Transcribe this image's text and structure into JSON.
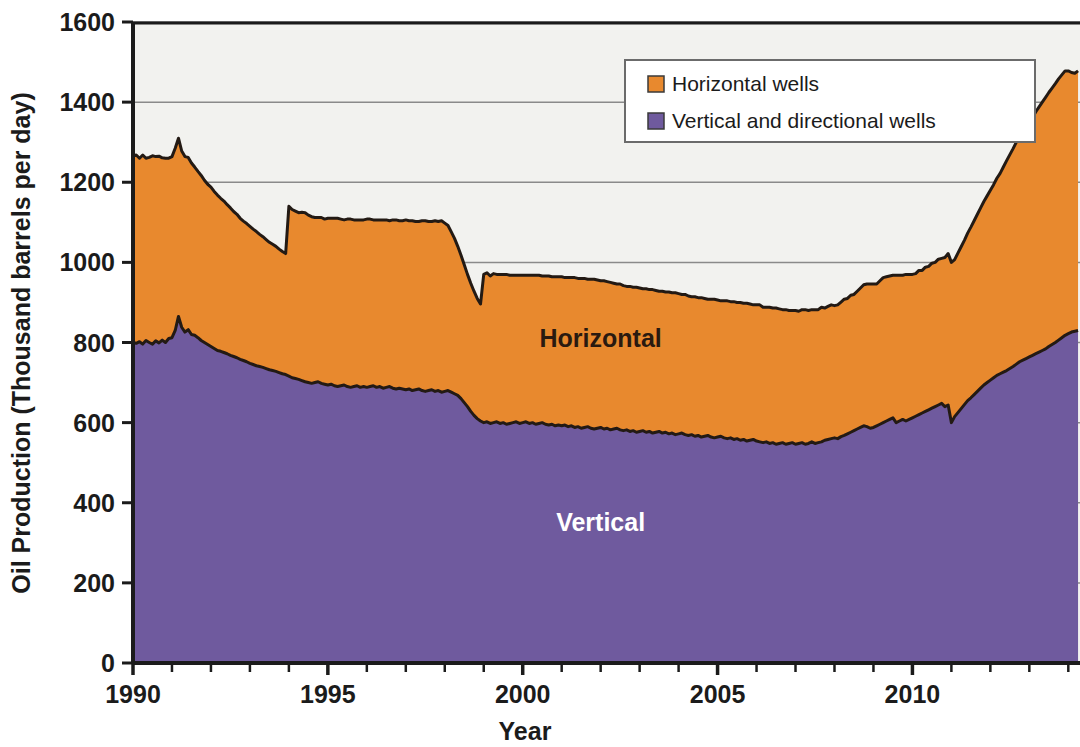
{
  "chart_data": {
    "type": "area",
    "title": "",
    "subtitle": "",
    "xlabel": "Year",
    "ylabel": "Oil Production (Thousand barrels per day)",
    "xlim": [
      1990,
      2014.3
    ],
    "ylim": [
      0,
      1600
    ],
    "ytick_labels": [
      "0",
      "200",
      "400",
      "600",
      "800",
      "1000",
      "1200",
      "1400",
      "1600"
    ],
    "ytick_values": [
      0,
      200,
      400,
      600,
      800,
      1000,
      1200,
      1400,
      1600
    ],
    "xtick_labels": [
      "1990",
      "1995",
      "2000",
      "2005",
      "2010"
    ],
    "xtick_values": [
      1990,
      1995,
      2000,
      2005,
      2010
    ],
    "xtick_minor_step": 1,
    "grid": "horizontal",
    "stacked": true,
    "legend_position": "top-right",
    "legend": [
      {
        "label": "Horizontal wells",
        "color": "#E8892E"
      },
      {
        "label": "Vertical and directional wells",
        "color": "#6F5A9E"
      }
    ],
    "annotations": [
      {
        "text": "Horizontal",
        "x": 2002.0,
        "y": 790,
        "style": "dark"
      },
      {
        "text": "Vertical",
        "x": 2002.0,
        "y": 330,
        "style": "light"
      }
    ],
    "x": [
      1990.0,
      1990.083,
      1990.167,
      1990.25,
      1990.333,
      1990.417,
      1990.5,
      1990.583,
      1990.667,
      1990.75,
      1990.833,
      1990.917,
      1991.0,
      1991.083,
      1991.167,
      1991.25,
      1991.333,
      1991.417,
      1991.5,
      1991.583,
      1991.667,
      1991.75,
      1991.833,
      1991.917,
      1992.0,
      1992.083,
      1992.167,
      1992.25,
      1992.333,
      1992.417,
      1992.5,
      1992.583,
      1992.667,
      1992.75,
      1992.833,
      1992.917,
      1993.0,
      1993.083,
      1993.167,
      1993.25,
      1993.333,
      1993.417,
      1993.5,
      1993.583,
      1993.667,
      1993.75,
      1993.833,
      1993.917,
      1994.0,
      1994.083,
      1994.167,
      1994.25,
      1994.333,
      1994.417,
      1994.5,
      1994.583,
      1994.667,
      1994.75,
      1994.833,
      1994.917,
      1995.0,
      1995.083,
      1995.167,
      1995.25,
      1995.333,
      1995.417,
      1995.5,
      1995.583,
      1995.667,
      1995.75,
      1995.833,
      1995.917,
      1996.0,
      1996.083,
      1996.167,
      1996.25,
      1996.333,
      1996.417,
      1996.5,
      1996.583,
      1996.667,
      1996.75,
      1996.833,
      1996.917,
      1997.0,
      1997.083,
      1997.167,
      1997.25,
      1997.333,
      1997.417,
      1997.5,
      1997.583,
      1997.667,
      1997.75,
      1997.833,
      1997.917,
      1998.0,
      1998.083,
      1998.167,
      1998.25,
      1998.333,
      1998.417,
      1998.5,
      1998.583,
      1998.667,
      1998.75,
      1998.833,
      1998.917,
      1999.0,
      1999.083,
      1999.167,
      1999.25,
      1999.333,
      1999.417,
      1999.5,
      1999.583,
      1999.667,
      1999.75,
      1999.833,
      1999.917,
      2000.0,
      2000.083,
      2000.167,
      2000.25,
      2000.333,
      2000.417,
      2000.5,
      2000.583,
      2000.667,
      2000.75,
      2000.833,
      2000.917,
      2001.0,
      2001.083,
      2001.167,
      2001.25,
      2001.333,
      2001.417,
      2001.5,
      2001.583,
      2001.667,
      2001.75,
      2001.833,
      2001.917,
      2002.0,
      2002.083,
      2002.167,
      2002.25,
      2002.333,
      2002.417,
      2002.5,
      2002.583,
      2002.667,
      2002.75,
      2002.833,
      2002.917,
      2003.0,
      2003.083,
      2003.167,
      2003.25,
      2003.333,
      2003.417,
      2003.5,
      2003.583,
      2003.667,
      2003.75,
      2003.833,
      2003.917,
      2004.0,
      2004.083,
      2004.167,
      2004.25,
      2004.333,
      2004.417,
      2004.5,
      2004.583,
      2004.667,
      2004.75,
      2004.833,
      2004.917,
      2005.0,
      2005.083,
      2005.167,
      2005.25,
      2005.333,
      2005.417,
      2005.5,
      2005.583,
      2005.667,
      2005.75,
      2005.833,
      2005.917,
      2006.0,
      2006.083,
      2006.167,
      2006.25,
      2006.333,
      2006.417,
      2006.5,
      2006.583,
      2006.667,
      2006.75,
      2006.833,
      2006.917,
      2007.0,
      2007.083,
      2007.167,
      2007.25,
      2007.333,
      2007.417,
      2007.5,
      2007.583,
      2007.667,
      2007.75,
      2007.833,
      2007.917,
      2008.0,
      2008.083,
      2008.167,
      2008.25,
      2008.333,
      2008.417,
      2008.5,
      2008.583,
      2008.667,
      2008.75,
      2008.833,
      2008.917,
      2009.0,
      2009.083,
      2009.167,
      2009.25,
      2009.333,
      2009.417,
      2009.5,
      2009.583,
      2009.667,
      2009.75,
      2009.833,
      2009.917,
      2010.0,
      2010.083,
      2010.167,
      2010.25,
      2010.333,
      2010.417,
      2010.5,
      2010.583,
      2010.667,
      2010.75,
      2010.833,
      2010.917,
      2011.0,
      2011.083,
      2011.167,
      2011.25,
      2011.333,
      2011.417,
      2011.5,
      2011.583,
      2011.667,
      2011.75,
      2011.833,
      2011.917,
      2012.0,
      2012.083,
      2012.167,
      2012.25,
      2012.333,
      2012.417,
      2012.5,
      2012.583,
      2012.667,
      2012.75,
      2012.833,
      2012.917,
      2013.0,
      2013.083,
      2013.167,
      2013.25,
      2013.333,
      2013.417,
      2013.5,
      2013.583,
      2013.667,
      2013.75,
      2013.833,
      2013.917,
      2014.0,
      2014.083,
      2014.167,
      2014.25
    ],
    "series": [
      {
        "name": "Vertical and directional wells",
        "color": "#6F5A9E",
        "values": [
          800,
          798,
          802,
          796,
          805,
          800,
          796,
          804,
          799,
          806,
          800,
          810,
          812,
          830,
          865,
          838,
          826,
          832,
          820,
          818,
          812,
          805,
          800,
          795,
          790,
          785,
          780,
          778,
          775,
          772,
          768,
          765,
          762,
          758,
          755,
          752,
          748,
          745,
          742,
          740,
          738,
          735,
          732,
          730,
          728,
          725,
          722,
          720,
          716,
          712,
          710,
          708,
          705,
          702,
          700,
          698,
          700,
          702,
          698,
          696,
          694,
          696,
          692,
          690,
          692,
          694,
          690,
          688,
          690,
          692,
          688,
          690,
          688,
          690,
          692,
          688,
          690,
          686,
          688,
          690,
          686,
          684,
          686,
          684,
          682,
          684,
          680,
          682,
          684,
          680,
          678,
          680,
          682,
          678,
          680,
          676,
          678,
          680,
          676,
          672,
          668,
          660,
          650,
          640,
          628,
          618,
          610,
          604,
          600,
          602,
          598,
          600,
          602,
          598,
          600,
          596,
          598,
          600,
          602,
          598,
          600,
          602,
          598,
          600,
          596,
          598,
          600,
          596,
          594,
          596,
          592,
          594,
          592,
          594,
          590,
          592,
          588,
          590,
          586,
          588,
          590,
          586,
          584,
          586,
          588,
          584,
          586,
          582,
          584,
          586,
          582,
          580,
          582,
          578,
          580,
          576,
          578,
          580,
          576,
          578,
          574,
          576,
          578,
          574,
          576,
          572,
          574,
          570,
          572,
          574,
          570,
          568,
          570,
          566,
          568,
          564,
          566,
          568,
          564,
          562,
          564,
          566,
          562,
          560,
          562,
          558,
          560,
          556,
          558,
          554,
          556,
          558,
          554,
          552,
          550,
          552,
          548,
          550,
          546,
          548,
          550,
          546,
          548,
          550,
          546,
          548,
          550,
          546,
          548,
          552,
          548,
          550,
          552,
          556,
          558,
          560,
          562,
          560,
          565,
          568,
          572,
          576,
          580,
          584,
          588,
          592,
          590,
          586,
          588,
          592,
          596,
          600,
          604,
          608,
          612,
          600,
          604,
          608,
          604,
          608,
          612,
          616,
          620,
          624,
          628,
          632,
          636,
          640,
          644,
          648,
          640,
          644,
          600,
          615,
          625,
          635,
          645,
          655,
          662,
          670,
          678,
          686,
          694,
          700,
          706,
          712,
          718,
          722,
          726,
          730,
          735,
          740,
          746,
          752,
          756,
          760,
          764,
          768,
          772,
          776,
          780,
          784,
          790,
          795,
          800,
          806,
          812,
          818,
          822,
          826,
          828,
          830
        ]
      },
      {
        "name": "Horizontal wells",
        "color": "#E8892E",
        "values": [
          465,
          470,
          458,
          472,
          455,
          462,
          470,
          460,
          466,
          455,
          460,
          450,
          452,
          455,
          445,
          440,
          438,
          430,
          428,
          420,
          415,
          412,
          405,
          400,
          398,
          392,
          388,
          382,
          378,
          372,
          368,
          362,
          358,
          352,
          348,
          345,
          342,
          338,
          335,
          330,
          326,
          322,
          318,
          315,
          312,
          308,
          305,
          302,
          424,
          420,
          418,
          416,
          420,
          422,
          418,
          416,
          412,
          410,
          414,
          412,
          416,
          414,
          418,
          420,
          416,
          412,
          418,
          420,
          416,
          414,
          418,
          416,
          420,
          418,
          414,
          418,
          416,
          420,
          418,
          414,
          420,
          422,
          418,
          420,
          424,
          420,
          424,
          420,
          418,
          424,
          426,
          422,
          420,
          426,
          422,
          428,
          420,
          412,
          400,
          388,
          372,
          358,
          344,
          330,
          320,
          310,
          300,
          292,
          370,
          372,
          368,
          372,
          368,
          372,
          370,
          374,
          370,
          368,
          366,
          370,
          368,
          366,
          370,
          368,
          372,
          370,
          366,
          370,
          372,
          368,
          372,
          370,
          372,
          368,
          372,
          370,
          374,
          370,
          374,
          372,
          368,
          372,
          374,
          370,
          366,
          370,
          366,
          368,
          364,
          360,
          364,
          362,
          358,
          362,
          358,
          362,
          358,
          354,
          358,
          354,
          358,
          354,
          350,
          354,
          350,
          354,
          350,
          354,
          350,
          346,
          350,
          348,
          344,
          348,
          344,
          348,
          344,
          340,
          344,
          346,
          342,
          338,
          342,
          344,
          340,
          344,
          340,
          344,
          340,
          344,
          340,
          336,
          340,
          342,
          338,
          336,
          340,
          336,
          340,
          336,
          332,
          336,
          332,
          330,
          334,
          330,
          332,
          336,
          332,
          330,
          334,
          332,
          336,
          330,
          332,
          334,
          330,
          334,
          336,
          340,
          338,
          342,
          340,
          344,
          348,
          352,
          356,
          360,
          358,
          354,
          358,
          362,
          360,
          358,
          356,
          368,
          364,
          360,
          366,
          362,
          358,
          356,
          360,
          356,
          360,
          358,
          362,
          360,
          364,
          362,
          372,
          378,
          400,
          392,
          398,
          404,
          410,
          418,
          426,
          434,
          442,
          450,
          458,
          466,
          474,
          482,
          492,
          500,
          512,
          524,
          534,
          544,
          554,
          562,
          570,
          578,
          586,
          594,
          604,
          612,
          620,
          628,
          634,
          640,
          646,
          652,
          656,
          660,
          656,
          648,
          644,
          648
        ]
      }
    ]
  },
  "axes": {
    "x_title": "Year",
    "y_title": "Oil Production (Thousand barrels per day)"
  },
  "legend": {
    "items": [
      {
        "label": "Horizontal wells",
        "swatch": "#E8892E"
      },
      {
        "label": "Vertical and directional wells",
        "swatch": "#6F5A9E"
      }
    ]
  },
  "plot_labels": {
    "horizontal": "Horizontal",
    "vertical": "Vertical"
  },
  "colors": {
    "horizontal": "#E8892E",
    "vertical": "#6F5A9E",
    "plot_background": "#F2F2EF",
    "gridline": "#8a8a8a",
    "axis": "#1b1b1b",
    "curve_outline": "#231a14",
    "page_background": "#ffffff"
  }
}
